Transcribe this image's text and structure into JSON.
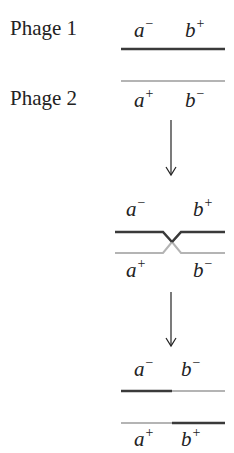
{
  "colors": {
    "dark": "#3a3a3a",
    "light": "#b4b4b4"
  },
  "labels": {
    "phage1": "Phage 1",
    "phage2": "Phage 2"
  },
  "stage1": {
    "top": [
      {
        "gene": "a",
        "sign": "−"
      },
      {
        "gene": "b",
        "sign": "+"
      }
    ],
    "bottom": [
      {
        "gene": "a",
        "sign": "+"
      },
      {
        "gene": "b",
        "sign": "−"
      }
    ]
  },
  "stage2": {
    "top": [
      {
        "gene": "a",
        "sign": "−"
      },
      {
        "gene": "b",
        "sign": "+"
      }
    ],
    "bottom": [
      {
        "gene": "a",
        "sign": "+"
      },
      {
        "gene": "b",
        "sign": "−"
      }
    ]
  },
  "stage3": {
    "top": [
      {
        "gene": "a",
        "sign": "−"
      },
      {
        "gene": "b",
        "sign": "−"
      }
    ],
    "bottom": [
      {
        "gene": "a",
        "sign": "+"
      },
      {
        "gene": "b",
        "sign": "+"
      }
    ]
  }
}
